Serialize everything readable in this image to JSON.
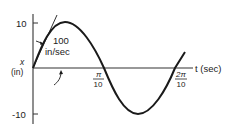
{
  "diagram": {
    "type": "sine-wave-plot",
    "y_axis": {
      "label_var": "x",
      "label_unit": "(in)",
      "ticks": [
        {
          "label": "10",
          "value": 10
        },
        {
          "label": "-10",
          "value": -10
        }
      ]
    },
    "x_axis": {
      "label": "t (sec)",
      "ticks": [
        {
          "label_num": "π",
          "label_den": "10",
          "value": "π/10"
        },
        {
          "label_num": "2π",
          "label_den": "10",
          "value": "2π/10"
        }
      ]
    },
    "annotation": {
      "line1": "100",
      "line2": "in/sec",
      "meaning": "initial slope (tangent) at origin"
    },
    "curve": {
      "function": "x = 10 sin(10 t)",
      "amplitude": 10,
      "period": "2π/10"
    },
    "colors": {
      "stroke": "#1a1a1a",
      "axis": "#333333",
      "background": "#ffffff"
    }
  }
}
